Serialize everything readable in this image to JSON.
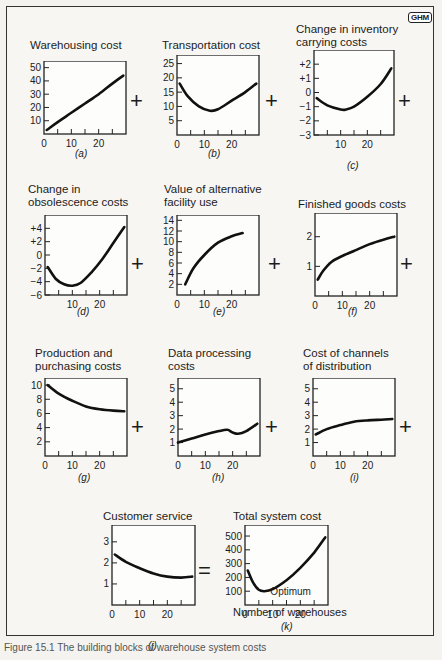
{
  "logo": "GHM",
  "caption": "Figure 15.1   The building blocks of warehouse system costs",
  "x_axis_caption": "Number of warehouses",
  "operators": {
    "plus": "+",
    "equals": "="
  },
  "panels": [
    {
      "id": "a",
      "title_lines": [
        "Warehousing cost"
      ],
      "label": "(a)"
    },
    {
      "id": "b",
      "title_lines": [
        "Transportation cost"
      ],
      "label": "(b)"
    },
    {
      "id": "c",
      "title_lines": [
        "Change in inventory",
        "carrying costs"
      ],
      "label": "(c)"
    },
    {
      "id": "d",
      "title_lines": [
        "Change in",
        "obsolescence costs"
      ],
      "label": "(d)"
    },
    {
      "id": "e",
      "title_lines": [
        "Value of alternative",
        "facility use"
      ],
      "label": "(e)"
    },
    {
      "id": "f",
      "title_lines": [
        "Finished goods costs"
      ],
      "label": "(f)"
    },
    {
      "id": "g",
      "title_lines": [
        "Production and",
        "purchasing costs"
      ],
      "label": "(g)"
    },
    {
      "id": "h",
      "title_lines": [
        "Data processing",
        "costs"
      ],
      "label": "(h)"
    },
    {
      "id": "i",
      "title_lines": [
        "Cost of channels",
        "of distribution"
      ],
      "label": "(i)"
    },
    {
      "id": "j",
      "title_lines": [
        "Customer service"
      ],
      "label": "(j)"
    },
    {
      "id": "k",
      "title_lines": [
        "Total system cost"
      ],
      "label": "(k)",
      "annotation": "Optimum"
    }
  ],
  "chart_data": [
    {
      "id": "a",
      "type": "line",
      "title": "Warehousing cost",
      "xlabel": "Number of warehouses",
      "xlim": [
        0,
        30
      ],
      "ylim": [
        0,
        55
      ],
      "xticks": [
        0,
        10,
        20
      ],
      "yticks": [
        10,
        20,
        30,
        40,
        50
      ],
      "ytick_labels": [
        "10",
        "20",
        "30",
        "40",
        "50"
      ],
      "x": [
        1,
        5,
        10,
        15,
        20,
        25,
        29
      ],
      "y": [
        3,
        9,
        16,
        23,
        30,
        38,
        44
      ]
    },
    {
      "id": "b",
      "type": "line",
      "title": "Transportation cost",
      "xlim": [
        0,
        30
      ],
      "ylim": [
        0,
        28
      ],
      "xticks": [
        0,
        10,
        20
      ],
      "yticks": [
        5,
        10,
        15,
        20,
        25
      ],
      "ytick_labels": [
        "5",
        "10",
        "15",
        "20",
        "25"
      ],
      "x": [
        1,
        4,
        8,
        12,
        15,
        20,
        25,
        29
      ],
      "y": [
        18,
        13.5,
        10,
        8.5,
        9,
        12,
        15,
        18
      ]
    },
    {
      "id": "c",
      "type": "line",
      "title": "Change in inventory carrying costs",
      "xlim": [
        0,
        30
      ],
      "ylim": [
        -3,
        3
      ],
      "xticks": [
        10,
        20
      ],
      "yticks": [
        -3,
        -2,
        -1,
        0,
        1,
        2
      ],
      "ytick_labels": [
        "−3",
        "−2",
        "−1",
        "0",
        "+1",
        "+2"
      ],
      "x": [
        1,
        5,
        10,
        12,
        15,
        20,
        25,
        29
      ],
      "y": [
        -0.4,
        -0.9,
        -1.2,
        -1.2,
        -1.0,
        -0.3,
        0.6,
        1.7
      ]
    },
    {
      "id": "d",
      "type": "line",
      "title": "Change in obsolescence costs",
      "xlim": [
        0,
        30
      ],
      "ylim": [
        -6,
        6
      ],
      "xticks": [
        10,
        20
      ],
      "yticks": [
        -6,
        -4,
        -2,
        0,
        2,
        4
      ],
      "ytick_labels": [
        "−6",
        "−4",
        "−2",
        "0",
        "+2",
        "+4"
      ],
      "x": [
        1,
        4,
        7,
        10,
        13,
        17,
        21,
        25,
        29
      ],
      "y": [
        -1.8,
        -3.6,
        -4.4,
        -4.6,
        -4.2,
        -2.6,
        -0.6,
        1.8,
        4.2
      ]
    },
    {
      "id": "e",
      "type": "line",
      "title": "Value of alternative facility use",
      "xlim": [
        0,
        30
      ],
      "ylim": [
        0,
        15
      ],
      "xticks": [
        0,
        10,
        20
      ],
      "yticks": [
        2,
        4,
        6,
        8,
        10,
        12,
        14
      ],
      "ytick_labels": [
        "2",
        "4",
        "6",
        "8",
        "10",
        "12",
        "14"
      ],
      "x": [
        3,
        6,
        10,
        15,
        20,
        24
      ],
      "y": [
        2,
        5,
        7.5,
        9.8,
        11,
        11.6
      ]
    },
    {
      "id": "f",
      "type": "line",
      "title": "Finished goods costs",
      "xlim": [
        0,
        30
      ],
      "ylim": [
        0,
        2.8
      ],
      "xticks": [
        0,
        10,
        20
      ],
      "yticks": [
        1,
        2
      ],
      "ytick_labels": [
        "1",
        "2"
      ],
      "x": [
        1,
        3,
        6,
        10,
        15,
        20,
        25,
        29
      ],
      "y": [
        0.55,
        0.85,
        1.15,
        1.35,
        1.55,
        1.75,
        1.9,
        2.0
      ]
    },
    {
      "id": "g",
      "type": "line",
      "title": "Production and purchasing costs",
      "xlim": [
        0,
        30
      ],
      "ylim": [
        0,
        11
      ],
      "xticks": [
        0,
        10,
        20
      ],
      "yticks": [
        2,
        4,
        6,
        8,
        10
      ],
      "ytick_labels": [
        "2",
        "4",
        "6",
        "8",
        "10"
      ],
      "x": [
        1,
        5,
        10,
        15,
        20,
        25,
        29
      ],
      "y": [
        10,
        8.8,
        7.8,
        7.0,
        6.6,
        6.4,
        6.3
      ]
    },
    {
      "id": "h",
      "type": "line",
      "title": "Data processing costs",
      "xlim": [
        0,
        30
      ],
      "ylim": [
        0,
        5.8
      ],
      "xticks": [
        0,
        10,
        20
      ],
      "yticks": [
        1,
        2,
        3,
        4,
        5
      ],
      "ytick_labels": [
        "1",
        "2",
        "3",
        "4",
        "5"
      ],
      "x": [
        0,
        5,
        10,
        15,
        18,
        20,
        22,
        25,
        29
      ],
      "y": [
        1.0,
        1.3,
        1.6,
        1.85,
        1.95,
        1.75,
        1.65,
        1.85,
        2.4
      ]
    },
    {
      "id": "i",
      "type": "line",
      "title": "Cost of channels of distribution",
      "xlim": [
        0,
        30
      ],
      "ylim": [
        0,
        5.8
      ],
      "xticks": [
        0,
        10,
        20
      ],
      "yticks": [
        1,
        2,
        3,
        4,
        5
      ],
      "ytick_labels": [
        "1",
        "2",
        "3",
        "4",
        "5"
      ],
      "x": [
        1,
        5,
        10,
        15,
        20,
        25,
        29
      ],
      "y": [
        1.6,
        2.0,
        2.3,
        2.55,
        2.65,
        2.7,
        2.75
      ]
    },
    {
      "id": "j",
      "type": "line",
      "title": "Customer service",
      "xlim": [
        0,
        30
      ],
      "ylim": [
        0,
        3.8
      ],
      "xticks": [
        0,
        10,
        20
      ],
      "yticks": [
        1,
        2,
        3
      ],
      "ytick_labels": [
        "1",
        "2",
        "3"
      ],
      "x": [
        1,
        5,
        10,
        15,
        20,
        25,
        29
      ],
      "y": [
        2.4,
        2.05,
        1.75,
        1.5,
        1.35,
        1.3,
        1.35
      ]
    },
    {
      "id": "k",
      "type": "line",
      "title": "Total system cost",
      "xlabel": "Number of warehouses",
      "xlim": [
        0,
        30
      ],
      "ylim": [
        0,
        580
      ],
      "xticks": [
        0,
        10,
        20
      ],
      "yticks": [
        100,
        200,
        300,
        400,
        500
      ],
      "ytick_labels": [
        "100",
        "200",
        "300",
        "400",
        "500"
      ],
      "annotation": {
        "text": "Optimum",
        "x": 7,
        "y": 100
      },
      "x": [
        1,
        3,
        5,
        7,
        10,
        15,
        20,
        25,
        29
      ],
      "y": [
        250,
        160,
        110,
        100,
        115,
        180,
        270,
        380,
        490
      ]
    }
  ]
}
